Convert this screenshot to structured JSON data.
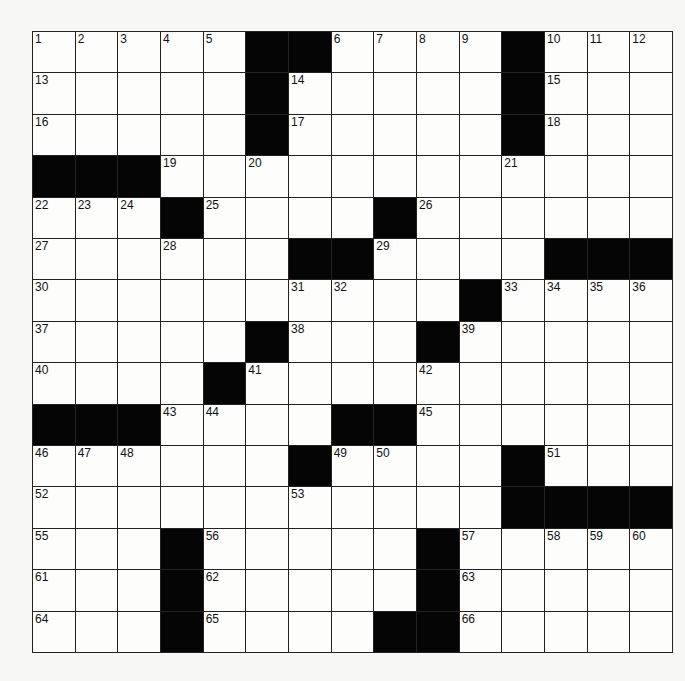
{
  "puzzle": {
    "rows": 15,
    "cols": 15,
    "grid": [
      ".....##....#...",
      ".....#.....#...",
      ".....#.....#...",
      "###............",
      "...#....#......",
      "......##....###",
      "..........#....",
      ".....#...#.....",
      "....#..........",
      "###....##......",
      "......#....#...",
      "...........####",
      "...#.....#.....",
      "...#.....#.....",
      "...#....##....."
    ],
    "numbers": [
      {
        "r": 0,
        "c": 0,
        "n": "1"
      },
      {
        "r": 0,
        "c": 1,
        "n": "2"
      },
      {
        "r": 0,
        "c": 2,
        "n": "3"
      },
      {
        "r": 0,
        "c": 3,
        "n": "4"
      },
      {
        "r": 0,
        "c": 4,
        "n": "5"
      },
      {
        "r": 0,
        "c": 7,
        "n": "6"
      },
      {
        "r": 0,
        "c": 8,
        "n": "7"
      },
      {
        "r": 0,
        "c": 9,
        "n": "8"
      },
      {
        "r": 0,
        "c": 10,
        "n": "9"
      },
      {
        "r": 0,
        "c": 12,
        "n": "10"
      },
      {
        "r": 0,
        "c": 13,
        "n": "11"
      },
      {
        "r": 0,
        "c": 14,
        "n": "12"
      },
      {
        "r": 1,
        "c": 0,
        "n": "13"
      },
      {
        "r": 1,
        "c": 6,
        "n": "14"
      },
      {
        "r": 1,
        "c": 12,
        "n": "15"
      },
      {
        "r": 2,
        "c": 0,
        "n": "16"
      },
      {
        "r": 2,
        "c": 6,
        "n": "17"
      },
      {
        "r": 2,
        "c": 12,
        "n": "18"
      },
      {
        "r": 3,
        "c": 3,
        "n": "19"
      },
      {
        "r": 3,
        "c": 5,
        "n": "20"
      },
      {
        "r": 3,
        "c": 11,
        "n": "21"
      },
      {
        "r": 4,
        "c": 0,
        "n": "22"
      },
      {
        "r": 4,
        "c": 1,
        "n": "23"
      },
      {
        "r": 4,
        "c": 2,
        "n": "24"
      },
      {
        "r": 4,
        "c": 4,
        "n": "25"
      },
      {
        "r": 4,
        "c": 9,
        "n": "26"
      },
      {
        "r": 5,
        "c": 0,
        "n": "27"
      },
      {
        "r": 5,
        "c": 3,
        "n": "28"
      },
      {
        "r": 5,
        "c": 8,
        "n": "29"
      },
      {
        "r": 6,
        "c": 0,
        "n": "30"
      },
      {
        "r": 6,
        "c": 6,
        "n": "31"
      },
      {
        "r": 6,
        "c": 7,
        "n": "32"
      },
      {
        "r": 6,
        "c": 11,
        "n": "33"
      },
      {
        "r": 6,
        "c": 12,
        "n": "34"
      },
      {
        "r": 6,
        "c": 13,
        "n": "35"
      },
      {
        "r": 6,
        "c": 14,
        "n": "36"
      },
      {
        "r": 7,
        "c": 0,
        "n": "37"
      },
      {
        "r": 7,
        "c": 6,
        "n": "38"
      },
      {
        "r": 7,
        "c": 10,
        "n": "39"
      },
      {
        "r": 8,
        "c": 0,
        "n": "40"
      },
      {
        "r": 8,
        "c": 5,
        "n": "41"
      },
      {
        "r": 8,
        "c": 9,
        "n": "42"
      },
      {
        "r": 9,
        "c": 3,
        "n": "43"
      },
      {
        "r": 9,
        "c": 4,
        "n": "44"
      },
      {
        "r": 9,
        "c": 9,
        "n": "45"
      },
      {
        "r": 10,
        "c": 0,
        "n": "46"
      },
      {
        "r": 10,
        "c": 1,
        "n": "47"
      },
      {
        "r": 10,
        "c": 2,
        "n": "48"
      },
      {
        "r": 10,
        "c": 7,
        "n": "49"
      },
      {
        "r": 10,
        "c": 8,
        "n": "50"
      },
      {
        "r": 10,
        "c": 12,
        "n": "51"
      },
      {
        "r": 11,
        "c": 0,
        "n": "52"
      },
      {
        "r": 11,
        "c": 6,
        "n": "53"
      },
      {
        "r": 11,
        "c": 11,
        "n": "54"
      },
      {
        "r": 12,
        "c": 0,
        "n": "55"
      },
      {
        "r": 12,
        "c": 4,
        "n": "56"
      },
      {
        "r": 12,
        "c": 10,
        "n": "57"
      },
      {
        "r": 12,
        "c": 12,
        "n": "58"
      },
      {
        "r": 12,
        "c": 13,
        "n": "59"
      },
      {
        "r": 12,
        "c": 14,
        "n": "60"
      },
      {
        "r": 13,
        "c": 0,
        "n": "61"
      },
      {
        "r": 13,
        "c": 4,
        "n": "62"
      },
      {
        "r": 13,
        "c": 10,
        "n": "63"
      },
      {
        "r": 14,
        "c": 0,
        "n": "64"
      },
      {
        "r": 14,
        "c": 4,
        "n": "65"
      },
      {
        "r": 14,
        "c": 10,
        "n": "66"
      }
    ],
    "entries": []
  }
}
